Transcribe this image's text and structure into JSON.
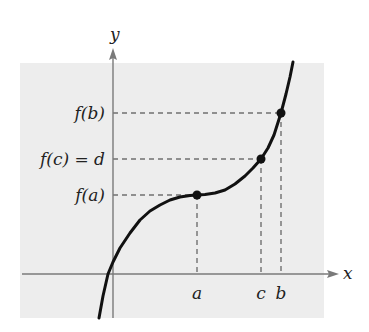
{
  "figure": {
    "colors": {
      "background_panel": "#ededed",
      "axis": "#7a7a7a",
      "dashes": "#707070",
      "curve": "#111111",
      "text": "#222222"
    },
    "axes": {
      "x_label": "x",
      "y_label": "y"
    },
    "x_ticks": [
      {
        "label": "a",
        "px": 197
      },
      {
        "label": "c",
        "px": 261
      },
      {
        "label": "b",
        "px": 281
      }
    ],
    "y_ticks": [
      {
        "label": "f(b)",
        "py": 113
      },
      {
        "label": "f(c) = d",
        "py": 159
      },
      {
        "label": "f(a)",
        "py": 195
      }
    ],
    "points": [
      {
        "name": "a",
        "px": 197,
        "py": 195
      },
      {
        "name": "c",
        "px": 261,
        "py": 159
      },
      {
        "name": "b",
        "px": 281,
        "py": 113
      }
    ],
    "curve_px": [
      [
        99,
        318
      ],
      [
        103,
        296
      ],
      [
        108,
        274
      ],
      [
        113,
        262
      ],
      [
        120,
        248
      ],
      [
        130,
        233
      ],
      [
        140,
        220
      ],
      [
        150,
        211
      ],
      [
        160,
        205
      ],
      [
        170,
        200
      ],
      [
        180,
        197
      ],
      [
        190,
        195.5
      ],
      [
        197,
        195
      ],
      [
        205,
        194.5
      ],
      [
        215,
        193
      ],
      [
        225,
        190
      ],
      [
        235,
        184
      ],
      [
        245,
        176
      ],
      [
        253,
        168
      ],
      [
        261,
        159
      ],
      [
        268,
        148
      ],
      [
        274,
        135
      ],
      [
        281,
        113
      ],
      [
        286,
        94
      ],
      [
        290,
        77
      ],
      [
        293,
        62
      ]
    ]
  }
}
